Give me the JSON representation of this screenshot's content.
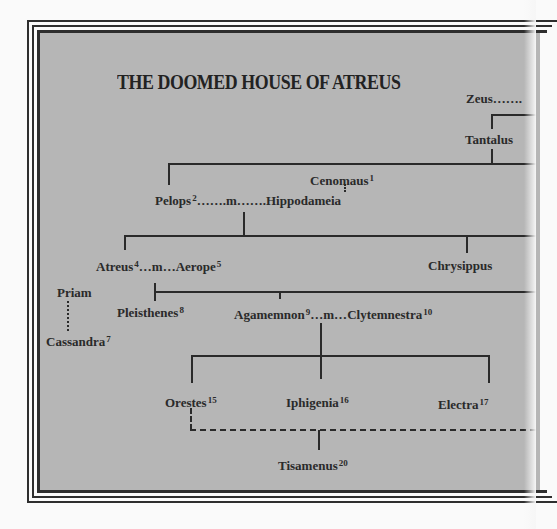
{
  "title": "THE DOOMED HOUSE OF ATREUS",
  "people": {
    "zeus": {
      "name": "Zeus",
      "suffix": "……."
    },
    "tantalus": {
      "name": "Tantalus"
    },
    "oenomaus": {
      "name": "Cenomaus",
      "note": "1"
    },
    "pelops": {
      "name": "Pelops",
      "note": "2"
    },
    "marriage_pelops": {
      "text": "…….m……."
    },
    "hippodameia": {
      "name": "Hippodameia"
    },
    "atreus": {
      "name": "Atreus",
      "note": "4"
    },
    "marriage_atreus": {
      "text": "…m…"
    },
    "aerope": {
      "name": "Aerope",
      "note": "5"
    },
    "chrysippus": {
      "name": "Chrysippus"
    },
    "priam": {
      "name": "Priam"
    },
    "cassandra": {
      "name": "Cassandra",
      "note": "7"
    },
    "pleisthenes": {
      "name": "Pleisthenes",
      "note": "8"
    },
    "agamemnon": {
      "name": "Agamemnon",
      "note": "9"
    },
    "marriage_agamemnon": {
      "text": "…m…"
    },
    "clytemnestra": {
      "name": "Clytemnestra",
      "note": "10"
    },
    "orestes": {
      "name": "Orestes",
      "note": "15"
    },
    "iphigenia": {
      "name": "Iphigenia",
      "note": "16"
    },
    "electra": {
      "name": "Electra",
      "note": "17"
    },
    "tisamenus": {
      "name": "Tisamenus",
      "note": "20"
    }
  },
  "colors": {
    "panel": "#b6b6b6",
    "ink": "#2a2a2a",
    "page": "#fafafa"
  }
}
